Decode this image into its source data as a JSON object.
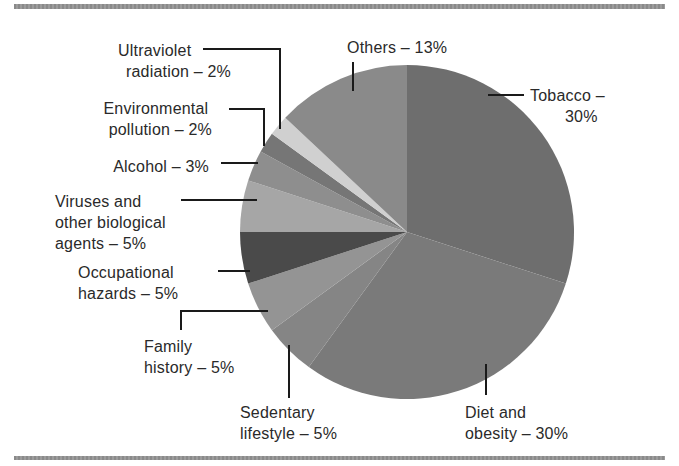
{
  "chart_data": {
    "type": "pie",
    "title": "",
    "start_angle_deg": 0,
    "direction": "clockwise",
    "center": [
      407,
      232
    ],
    "radius": 167,
    "slices": [
      {
        "label": "Tobacco",
        "value": 30,
        "color": "#6e6e6e"
      },
      {
        "label": "Diet and obesity",
        "value": 30,
        "color": "#7a7a7a"
      },
      {
        "label": "Sedentary lifestyle",
        "value": 5,
        "color": "#858585"
      },
      {
        "label": "Family history",
        "value": 5,
        "color": "#949494"
      },
      {
        "label": "Occupational hazards",
        "value": 5,
        "color": "#4a4a4a"
      },
      {
        "label": "Viruses and other biological agents",
        "value": 5,
        "color": "#a6a6a6"
      },
      {
        "label": "Alcohol",
        "value": 3,
        "color": "#8e8e8e"
      },
      {
        "label": "Environmental pollution",
        "value": 2,
        "color": "#767676"
      },
      {
        "label": "Ultraviolet radiation",
        "value": 2,
        "color": "#d0d0d0"
      },
      {
        "label": "Others",
        "value": 13,
        "color": "#8a8a8a"
      }
    ],
    "categories": [
      "Tobacco",
      "Diet and obesity",
      "Sedentary lifestyle",
      "Family history",
      "Occupational hazards",
      "Viruses and other biological agents",
      "Alcohol",
      "Environmental pollution",
      "Ultraviolet radiation",
      "Others"
    ],
    "values": [
      30,
      30,
      5,
      5,
      5,
      5,
      3,
      2,
      2,
      13
    ],
    "unit": "%"
  },
  "labels": {
    "tobacco": [
      "Tobacco –",
      "30%"
    ],
    "diet": [
      "Diet  and",
      "obesity – 30%"
    ],
    "sedentary": [
      "Sedentary",
      "lifestyle – 5%"
    ],
    "family": [
      "Family",
      "history – 5%"
    ],
    "occupational": [
      "Occupational",
      "hazards – 5%"
    ],
    "viruses": [
      "Viruses and",
      "other biological",
      "agents – 5%"
    ],
    "alcohol": [
      "Alcohol – 3%"
    ],
    "environmental": [
      "Environmental",
      "pollution – 2%"
    ],
    "ultraviolet": [
      "Ultraviolet",
      "radiation – 2%"
    ],
    "others": [
      "Others – 13%"
    ]
  }
}
